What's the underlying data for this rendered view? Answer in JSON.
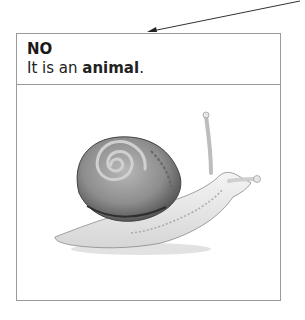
{
  "card": {
    "verdict": "NO",
    "explanation_prefix": "It is an ",
    "explanation_bold": "animal",
    "explanation_suffix": "."
  },
  "image": {
    "subject": "snail-illustration"
  }
}
